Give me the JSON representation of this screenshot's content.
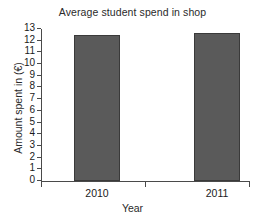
{
  "chart_data": {
    "type": "bar",
    "title": "Average student spend in shop",
    "xlabel": "Year",
    "ylabel": "Amount spent in (€)",
    "categories": [
      "2010",
      "2011"
    ],
    "values": [
      12.5,
      12.7
    ],
    "ylim": [
      0,
      13
    ],
    "ytick_step": 1,
    "yticks": [
      "13",
      "12",
      "11",
      "10",
      "9",
      "8",
      "7",
      "6",
      "5",
      "4",
      "3",
      "2",
      "1",
      "0"
    ],
    "grid": false,
    "legend": null,
    "bar_color": "#5a5a5a",
    "bar_edge_color": "#3a3a3a",
    "axis_color": "#4a4a4a",
    "background_color": "#ffffff"
  }
}
